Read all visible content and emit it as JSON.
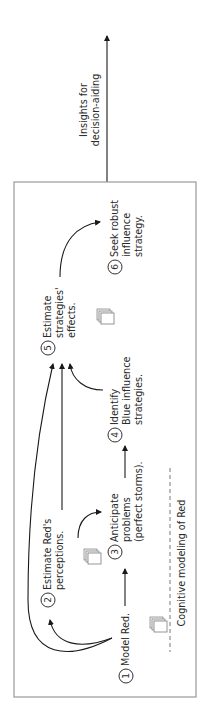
{
  "diagram": {
    "orientation": "rotated-90-ccw",
    "output_arrow_label": [
      "Insights for",
      "decision-aiding"
    ],
    "frame_label": "Cognitive modeling of Red",
    "steps": [
      {
        "number": "1",
        "lines": [
          "Model Red."
        ]
      },
      {
        "number": "2",
        "lines": [
          "Estimate Red's",
          "perceptions."
        ]
      },
      {
        "number": "3",
        "lines": [
          "Anticipate",
          "problems",
          "(perfect storms)."
        ]
      },
      {
        "number": "4",
        "lines": [
          "Identify",
          "Blue influence",
          "strategies."
        ]
      },
      {
        "number": "5",
        "lines": [
          "Estimate",
          "strategies'",
          "effects."
        ]
      },
      {
        "number": "6",
        "lines": [
          "Seek robust",
          "influence",
          "strategy."
        ]
      }
    ],
    "colors": {
      "line": "#1a1a1a",
      "frame": "#9a9a9a",
      "text": "#2a2a2a",
      "doc_fill": "#f2f2f2",
      "doc_stroke": "#7a7a7a"
    }
  }
}
